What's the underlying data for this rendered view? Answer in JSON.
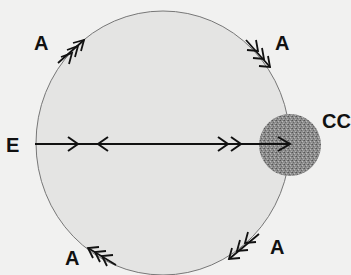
{
  "diagram": {
    "colors": {
      "background": "#f1f1f0",
      "circle_fill": "#e4e4e3",
      "circle_stroke": "#777777",
      "cc_fill": "#8a8a8a",
      "line": "#111111"
    },
    "big_circle": {
      "cx": 163,
      "cy": 143,
      "rx": 127,
      "ry": 132
    },
    "cc_circle": {
      "cx": 290,
      "cy": 145,
      "r": 31
    },
    "labels": [
      {
        "id": "A-top-left",
        "text": "A",
        "x": 34,
        "y": 33
      },
      {
        "id": "A-top-right",
        "text": "A",
        "x": 275,
        "y": 33
      },
      {
        "id": "CC",
        "text": "CC",
        "x": 322,
        "y": 111
      },
      {
        "id": "E",
        "text": "E",
        "x": 6,
        "y": 135
      },
      {
        "id": "A-bottom-left",
        "text": "A",
        "x": 65,
        "y": 248
      },
      {
        "id": "A-bottom-right",
        "text": "A",
        "x": 270,
        "y": 237
      }
    ],
    "axis_line": {
      "x1": 35,
      "x2": 290,
      "y": 144
    },
    "axis_arrows": [
      {
        "type": "single-right",
        "x": 78
      },
      {
        "type": "single-left",
        "x": 98
      },
      {
        "type": "double-right",
        "x": 230
      },
      {
        "type": "single-right-head",
        "x": 290
      }
    ],
    "arc_arrows": [
      {
        "position": "top-left",
        "direction": "clockwise"
      },
      {
        "position": "top-right",
        "direction": "clockwise"
      },
      {
        "position": "bottom-right",
        "direction": "clockwise"
      },
      {
        "position": "bottom-left",
        "direction": "clockwise"
      }
    ]
  }
}
